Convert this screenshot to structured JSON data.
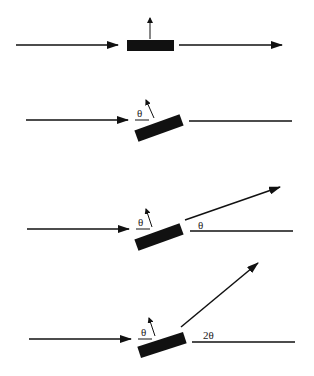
{
  "figure": {
    "panels": [
      {
        "id": "panel-1",
        "mirror_angle_label": null,
        "reflected_angle_label": null,
        "note": "Mirror horizontal; incident beam passes straight through"
      },
      {
        "id": "panel-2",
        "mirror_angle_label": "θ",
        "reflected_angle_label": null,
        "note": "Mirror tilted by θ; reference line only"
      },
      {
        "id": "panel-3",
        "mirror_angle_label": "θ",
        "reflected_angle_label": "θ",
        "note": "Reflected beam deflected by θ"
      },
      {
        "id": "panel-4",
        "mirror_angle_label": "θ",
        "reflected_angle_label": "2θ",
        "note": "Reflected beam deflected by 2θ"
      }
    ]
  },
  "colors": {
    "ink": "#111111",
    "background": "#ffffff"
  }
}
